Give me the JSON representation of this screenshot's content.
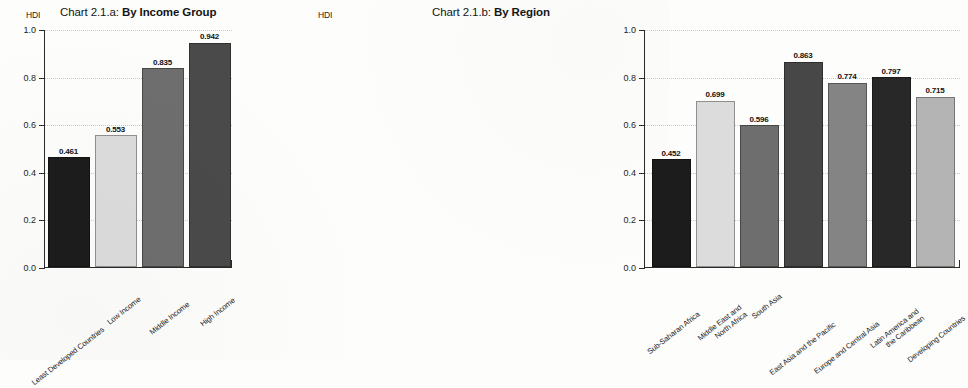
{
  "chart_data": [
    {
      "id": "chart-2-1-a",
      "type": "bar",
      "title_prefix": "Chart 2.1.a: ",
      "title_bold": "By Income Group",
      "ylabel": "HDI",
      "xlabel": "",
      "ylim": [
        0.0,
        1.0
      ],
      "ytick_labels": [
        "1.0",
        "0.8",
        "0.6",
        "0.4",
        "0.2",
        "0.0"
      ],
      "ytick_values": [
        1.0,
        0.8,
        0.6,
        0.4,
        0.2,
        0.0
      ],
      "grid": true,
      "legend": "none",
      "categories": [
        "Least Developed Countries",
        "Low Income",
        "Middle Income",
        "High Income"
      ],
      "values": [
        0.461,
        0.553,
        0.835,
        0.942
      ],
      "value_labels": [
        "0.461",
        "0.553",
        "0.835",
        "0.942"
      ],
      "colors": [
        "#1c1c1c",
        "#dcdcdc",
        "#6e6e6e",
        "#4a4a4a"
      ]
    },
    {
      "id": "chart-2-1-b",
      "type": "bar",
      "title_prefix": "Chart 2.1.b: ",
      "title_bold": "By Region",
      "ylabel": "HDI",
      "xlabel": "",
      "ylim": [
        0.0,
        1.0
      ],
      "ytick_labels": [
        "1.0",
        "0.8",
        "0.6",
        "0.4",
        "0.2",
        "0.0"
      ],
      "ytick_values": [
        1.0,
        0.8,
        0.6,
        0.4,
        0.2,
        0.0
      ],
      "grid": true,
      "legend": "none",
      "categories": [
        "Sub-Saharan Africa",
        "Middle East and\nNorth Africa",
        "South Asia",
        "East Asia and the Pacific",
        "Europe and Central Asia",
        "Latin America and\nthe Caribbean",
        "Developing Countries"
      ],
      "values": [
        0.452,
        0.699,
        0.596,
        0.863,
        0.774,
        0.797,
        0.715
      ],
      "value_labels": [
        "0.452",
        "0.699",
        "0.596",
        "0.863",
        "0.774",
        "0.797",
        "0.715"
      ],
      "colors": [
        "#1c1c1c",
        "#dcdcdc",
        "#6e6e6e",
        "#474747",
        "#848484",
        "#282828",
        "#b4b4b4"
      ]
    }
  ],
  "palette": {
    "background": "#fdfdfb",
    "axis": "#2a2a2a",
    "grid": "#c9c9c9",
    "text": "#1b1b1b"
  }
}
